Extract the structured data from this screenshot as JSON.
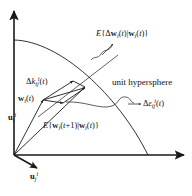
{
  "figure": {
    "type": "vector-diagram",
    "background_color": "#ffffff",
    "stroke_color": "#1a1a1a",
    "labels": {
      "expected_delta_w": {
        "text": "E{Δw_i(t)|w_i(t)}",
        "parts": [
          "E",
          "{",
          "Δ",
          "w",
          "i",
          "(t)",
          "|",
          "w",
          "i",
          "(t)",
          "}"
        ]
      },
      "unit_hypersphere": {
        "text": "unit hypersphere"
      },
      "delta_k": {
        "text": "Δk_ij^i(t)",
        "parts": [
          "Δ",
          "k",
          "ij",
          "i",
          "(t)"
        ]
      },
      "w_i_t": {
        "text": "w_i(t)",
        "parts": [
          "w",
          "i",
          "(t)"
        ]
      },
      "expected_w_next": {
        "text": "E{w_i(t+1)|w_i(t)}",
        "parts": [
          "E",
          "{",
          "w",
          "i",
          "(t+1)",
          "|",
          "w",
          "i",
          "(t)",
          "}"
        ]
      },
      "delta_epsilon": {
        "text": "Δε_ij^i(t)",
        "parts": [
          "Δ",
          "ε",
          "ij",
          "i",
          "(t)"
        ]
      },
      "axis_y": {
        "text": "u_i^i",
        "parts": [
          "u",
          "i",
          "i"
        ]
      },
      "axis_x_diag": {
        "text": "u_j^i",
        "parts": [
          "u",
          "j",
          "i"
        ]
      }
    },
    "geometry": {
      "origin": [
        14,
        155
      ],
      "y_axis_tip": [
        14,
        10
      ],
      "x_axis_tip": [
        185,
        155
      ],
      "arc_start": [
        14,
        40
      ],
      "arc_end": [
        148,
        155
      ],
      "w_point": [
        42,
        99
      ],
      "w_next_point": [
        84,
        87
      ],
      "k_tip": [
        72,
        82
      ],
      "eps_tip": [
        62,
        101
      ],
      "uj_tip": [
        38,
        168
      ]
    }
  }
}
